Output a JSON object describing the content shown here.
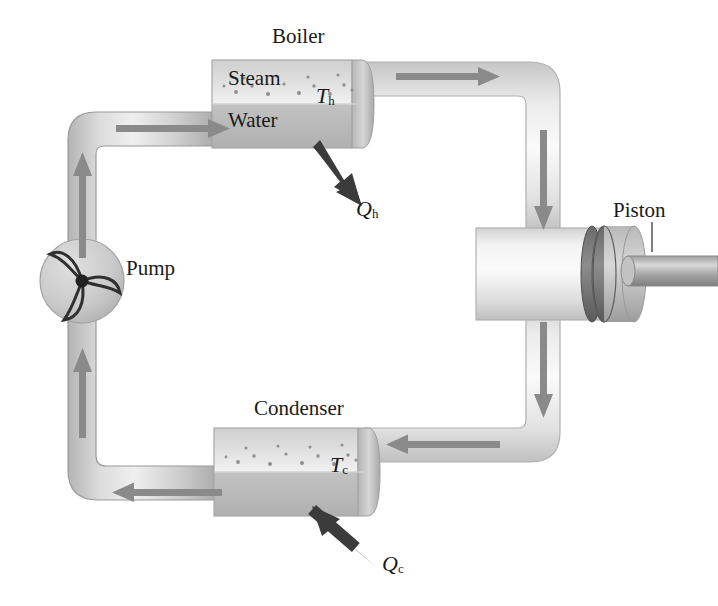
{
  "figure": {
    "type": "steam-engine-cycle-diagram"
  },
  "labels": {
    "boiler": "Boiler",
    "steam": "Steam",
    "water": "Water",
    "condenser": "Condenser",
    "pump": "Pump",
    "piston": "Piston",
    "t_hot": "T",
    "t_hot_sub": "h",
    "t_cold": "T",
    "t_cold_sub": "c",
    "q_hot": "Q",
    "q_hot_sub": "h",
    "q_cold": "Q",
    "q_cold_sub": "c"
  },
  "components": [
    {
      "name": "boiler",
      "label": "Boiler",
      "temperature": "T_h",
      "contents": [
        "Steam",
        "Water"
      ]
    },
    {
      "name": "piston",
      "label": "Piston"
    },
    {
      "name": "condenser",
      "label": "Condenser",
      "temperature": "T_c"
    },
    {
      "name": "pump",
      "label": "Pump"
    }
  ],
  "heat_flows": [
    {
      "name": "q-hot",
      "label": "Q_h",
      "direction": "into-boiler",
      "arrow": "up-left"
    },
    {
      "name": "q-cold",
      "label": "Q_c",
      "direction": "out-of-condenser",
      "arrow": "down-left"
    }
  ],
  "flow_arrows": [
    {
      "name": "flow-boiler-inlet",
      "direction": "right"
    },
    {
      "name": "flow-top-to-piston",
      "direction": "right"
    },
    {
      "name": "flow-right-down",
      "direction": "down"
    },
    {
      "name": "flow-piston-down",
      "direction": "down"
    },
    {
      "name": "flow-to-condenser",
      "direction": "left"
    },
    {
      "name": "flow-condenser-outlet",
      "direction": "left"
    },
    {
      "name": "flow-left-up",
      "direction": "up"
    },
    {
      "name": "flow-pump-up",
      "direction": "up"
    }
  ],
  "colors": {
    "pipe_light": "#e9e9e9",
    "pipe_mid": "#c9c9c9",
    "pipe_dark": "#a6a6a6",
    "vessel_body": "#c0c0c0",
    "vessel_steam": "#e4e4e4",
    "arrow_gray": "#8a8a8a",
    "heat_arrow": "#3b3b3b",
    "outline": "#9a9a9a",
    "text": "#1a1a1a",
    "background": "#ffffff"
  }
}
